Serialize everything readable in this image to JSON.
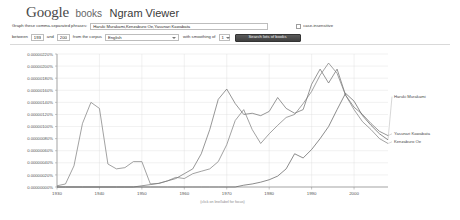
{
  "header": {
    "logo_google": "Google",
    "logo_books": "books",
    "logo_app": "Ngram Viewer"
  },
  "form": {
    "phrases_label": "Graph these comma-separated phrases:",
    "phrases_value": "Haruki Murakami,Kenzaburo Oe,Yasunari Kawabata",
    "phrases_placeholder": "Graph these comma-separated phrases",
    "case_insensitive_label": "case-insensitive",
    "case_insensitive_checked": false,
    "between_label": "between",
    "year_start": "1930",
    "and_label": "and",
    "year_end": "2008",
    "corpus_label": "from the corpus",
    "corpus_value": "English",
    "smoothing_label": "with smoothing of",
    "smoothing_value": "1",
    "search_button_label": "Search lots of books"
  },
  "chart_data": {
    "type": "line",
    "title": "",
    "xlabel": "",
    "ylabel": "",
    "footnote": "(click on line/label for focus)",
    "xlim": [
      1930,
      2008
    ],
    "ylim": [
      0.0,
      2.2e-06
    ],
    "grid": true,
    "legend_position": "right-inline",
    "xticks": [
      "1930",
      "1940",
      "1950",
      "1960",
      "1970",
      "1980",
      "1990",
      "2000"
    ],
    "xtick_values": [
      1930,
      1940,
      1950,
      1960,
      1970,
      1980,
      1990,
      2000
    ],
    "yticks": [
      "0.00000220%",
      "0.00000200%",
      "0.00000180%",
      "0.00000160%",
      "0.00000140%",
      "0.00000120%",
      "0.00000100%",
      "0.00000080%",
      "0.00000060%",
      "0.00000040%",
      "0.00000020%",
      "0.00000000%"
    ],
    "ytick_values": [
      2.2e-06,
      2e-06,
      1.8e-06,
      1.6e-06,
      1.4e-06,
      1.2e-06,
      1e-06,
      8e-07,
      6e-07,
      4e-07,
      2e-07,
      0.0
    ],
    "series": [
      {
        "name": "Haruki Murakami",
        "color": "#5a5a5a",
        "label_y_frac": 0.32,
        "x": [
          1930,
          1932,
          1934,
          1936,
          1938,
          1940,
          1942,
          1944,
          1946,
          1948,
          1950,
          1952,
          1954,
          1956,
          1958,
          1960,
          1962,
          1964,
          1966,
          1968,
          1970,
          1972,
          1974,
          1976,
          1978,
          1980,
          1982,
          1984,
          1986,
          1988,
          1990,
          1992,
          1994,
          1996,
          1998,
          2000,
          2002,
          2004,
          2006,
          2008
        ],
        "values": [
          0,
          0,
          0,
          0,
          0,
          0,
          0,
          0,
          0,
          0,
          0,
          0,
          0,
          0,
          0,
          0,
          0,
          0,
          0,
          0,
          0,
          0,
          3e-08,
          5e-08,
          8e-08,
          1.2e-07,
          1.8e-07,
          3e-07,
          5.5e-07,
          4.8e-07,
          6.2e-07,
          8e-07,
          1e-06,
          1.28e-06,
          1.55e-06,
          1.42e-06,
          1.18e-06,
          1.02e-06,
          8.8e-07,
          7.8e-07
        ]
      },
      {
        "name": "Yasunari Kawabata",
        "color": "#6a6a6a",
        "label_y_frac": 0.6,
        "x": [
          1930,
          1932,
          1934,
          1936,
          1938,
          1940,
          1942,
          1944,
          1946,
          1948,
          1950,
          1952,
          1954,
          1956,
          1958,
          1960,
          1962,
          1964,
          1966,
          1968,
          1970,
          1972,
          1974,
          1976,
          1978,
          1980,
          1982,
          1984,
          1986,
          1988,
          1990,
          1992,
          1994,
          1996,
          1998,
          2000,
          2002,
          2004,
          2006,
          2008
        ],
        "values": [
          0,
          0,
          0,
          0,
          0,
          0,
          0,
          0,
          0,
          0,
          2e-08,
          4e-08,
          6e-08,
          1e-07,
          1.4e-07,
          2.2e-07,
          3e-07,
          5.5e-07,
          9.5e-07,
          1.45e-06,
          1.62e-06,
          1.38e-06,
          1.2e-06,
          1.22e-06,
          1.18e-06,
          1.25e-06,
          1.48e-06,
          1.3e-06,
          1.22e-06,
          1.28e-06,
          1.7e-06,
          1.95e-06,
          1.72e-06,
          1.95e-06,
          1.52e-06,
          1.32e-06,
          1.2e-06,
          1.05e-06,
          9.2e-07,
          8.5e-07
        ]
      },
      {
        "name": "Kenzaburo Oe",
        "color": "#7a7a7a",
        "label_y_frac": 0.66,
        "x": [
          1930,
          1932,
          1934,
          1936,
          1938,
          1940,
          1942,
          1944,
          1946,
          1948,
          1950,
          1952,
          1954,
          1956,
          1958,
          1960,
          1962,
          1964,
          1966,
          1968,
          1970,
          1972,
          1974,
          1976,
          1978,
          1980,
          1982,
          1984,
          1986,
          1988,
          1990,
          1992,
          1994,
          1996,
          1998,
          2000,
          2002,
          2004,
          2006,
          2008
        ],
        "values": [
          2e-08,
          5e-08,
          3.5e-07,
          1.05e-06,
          1.4e-06,
          1.3e-06,
          3.8e-07,
          3e-07,
          3.2e-07,
          4.2e-07,
          4.2e-07,
          5e-08,
          6e-08,
          1e-07,
          1.6e-07,
          1.4e-07,
          2.2e-07,
          2.6e-07,
          3e-07,
          4.2e-07,
          7e-07,
          1.1e-06,
          1.28e-06,
          9.5e-07,
          7.2e-07,
          8.8e-07,
          1.02e-06,
          1.15e-06,
          1.2e-06,
          1.38e-06,
          1.58e-06,
          1.85e-06,
          2.05e-06,
          1.88e-06,
          1.52e-06,
          1.28e-06,
          1.08e-06,
          9.5e-07,
          8e-07,
          7.2e-07
        ]
      }
    ]
  }
}
